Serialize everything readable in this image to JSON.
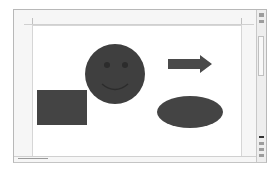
{
  "app": {
    "type": "document-canvas"
  },
  "canvas": {
    "shapes": [
      {
        "type": "smiley-face",
        "name": "smiley",
        "fill": "#3f3f3f"
      },
      {
        "type": "right-arrow",
        "name": "arrow",
        "fill": "#4a4a4a"
      },
      {
        "type": "rectangle",
        "name": "rectangle",
        "fill": "#444444"
      },
      {
        "type": "ellipse",
        "name": "oval",
        "fill": "#444444"
      }
    ]
  },
  "colors": {
    "shape_fill": "#444444",
    "page_bg": "#ffffff",
    "border": "#c8c8c8"
  }
}
